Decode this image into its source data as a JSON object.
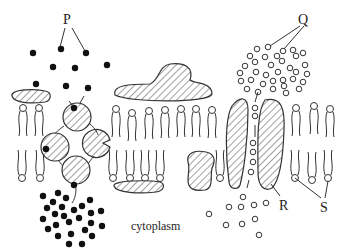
{
  "diagram": {
    "labels": {
      "P": "P",
      "Q": "Q",
      "R": "R",
      "S": "S",
      "cytoplasm": "cytoplasm"
    },
    "colors": {
      "stroke": "#333333",
      "solid_molecule": "#111111",
      "background": "#ffffff"
    },
    "legend_items": [
      {
        "key": "P",
        "description": "solid black molecules (outside, transported by carrier)"
      },
      {
        "key": "Q",
        "description": "hollow circle molecules (outside, passing through channel)"
      },
      {
        "key": "R",
        "description": "channel protein"
      },
      {
        "key": "S",
        "description": "phospholipid heads"
      }
    ]
  }
}
